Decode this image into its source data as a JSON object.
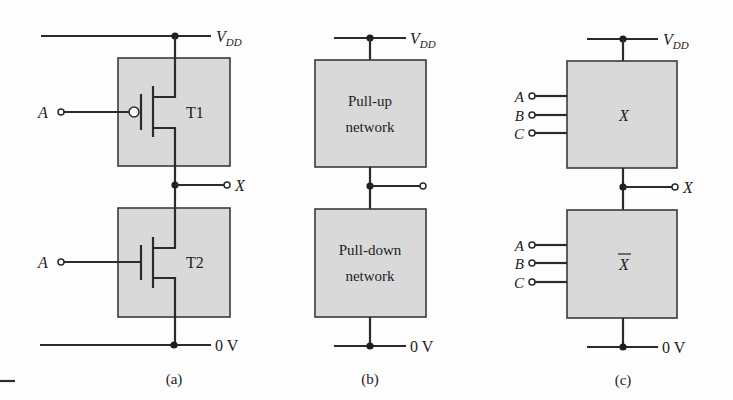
{
  "figure": {
    "panels": [
      {
        "id": "a",
        "caption": "(a)",
        "supply_label": "V",
        "supply_subscript": "DD",
        "ground_label": "0 V",
        "output_label": "X",
        "top_transistor": {
          "label": "T1",
          "type": "PMOS",
          "input_label": "A"
        },
        "bottom_transistor": {
          "label": "T2",
          "type": "NMOS",
          "input_label": "A"
        }
      },
      {
        "id": "b",
        "caption": "(b)",
        "supply_label": "V",
        "supply_subscript": "DD",
        "ground_label": "0 V",
        "top_block": {
          "line1": "Pull-up",
          "line2": "network"
        },
        "bottom_block": {
          "line1": "Pull-down",
          "line2": "network"
        }
      },
      {
        "id": "c",
        "caption": "(c)",
        "supply_label": "V",
        "supply_subscript": "DD",
        "ground_label": "0 V",
        "output_label": "X",
        "top_block": {
          "label": "X",
          "inputs": [
            "A",
            "B",
            "C"
          ]
        },
        "bottom_block": {
          "label": "X",
          "overbar": true,
          "inputs": [
            "A",
            "B",
            "C"
          ]
        }
      }
    ]
  },
  "colors": {
    "block_fill": "#d9d9d9",
    "wire": "#2b2b2b",
    "background": "#fdfdfd"
  }
}
